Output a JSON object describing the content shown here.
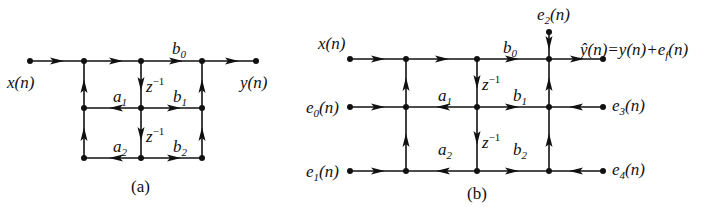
{
  "diagrams": [
    {
      "id": "a",
      "caption": "(a)",
      "labels": {
        "input": "x(n)",
        "output": "y(n)",
        "b0": "b",
        "b0_sub": "0",
        "b1": "b",
        "b1_sub": "1",
        "b2": "b",
        "b2_sub": "2",
        "a1": "a",
        "a1_sub": "1",
        "a2": "a",
        "a2_sub": "2",
        "delay1": "z",
        "delay1_sup": "−1",
        "delay2": "z",
        "delay2_sup": "−1"
      }
    },
    {
      "id": "b",
      "caption": "(b)",
      "labels": {
        "input": "x(n)",
        "output": "ŷ(n)=y(n)+e",
        "output_sub": "f",
        "output_tail": "(n)",
        "e0": "e",
        "e0_sub": "0",
        "e0_tail": "(n)",
        "e1": "e",
        "e1_sub": "1",
        "e1_tail": "(n)",
        "e2": "e",
        "e2_sub": "2",
        "e2_tail": "(n)",
        "e3": "e",
        "e3_sub": "3",
        "e3_tail": "(n)",
        "e4": "e",
        "e4_sub": "4",
        "e4_tail": "(n)",
        "b0": "b",
        "b0_sub": "0",
        "b1": "b",
        "b1_sub": "1",
        "b2": "b",
        "b2_sub": "2",
        "a1": "a",
        "a1_sub": "1",
        "a2": "a",
        "a2_sub": "2",
        "delay1": "z",
        "delay1_sup": "−1",
        "delay2": "z",
        "delay2_sup": "−1"
      }
    }
  ]
}
